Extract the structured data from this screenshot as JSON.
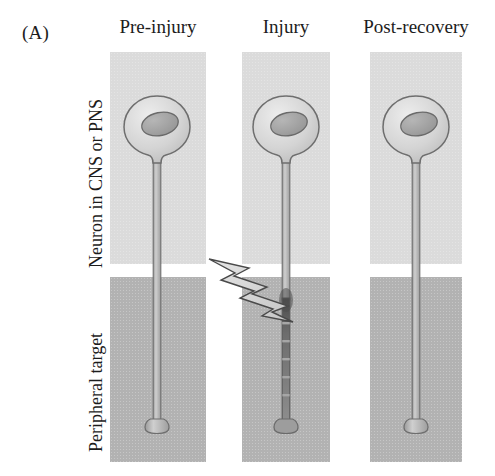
{
  "figure": {
    "panel_letter": "(A)",
    "columns": [
      {
        "id": "pre-injury",
        "label": "Pre-injury"
      },
      {
        "id": "injury",
        "label": "Injury"
      },
      {
        "id": "post-recovery",
        "label": "Post-recovery"
      }
    ],
    "rows": [
      {
        "id": "neuron",
        "label": "Neuron in CNS or PNS"
      },
      {
        "id": "peripheral-target",
        "label": "Peripheral target"
      }
    ],
    "colors": {
      "upper_panel": "#dbdbdb",
      "lower_panel": "#b2b2b2",
      "soma_fill": "#d2d2d2",
      "soma_outline": "#6e6e6e",
      "nucleus_fill": "#a3a3a3",
      "nucleus_outline": "#6a6a6a",
      "axon_fill": "#bdbdbd",
      "axon_outline": "#6e6e6e",
      "degenerating_axon": "#5f5f5f",
      "bolt_fill": "#d9d9d9",
      "bolt_outline": "#4a4a4a",
      "text": "#1c1c1c",
      "background": "#ffffff"
    },
    "elements": {
      "soma": "cell-body",
      "nucleus": "nucleus",
      "axon": "axon",
      "terminal": "axon-terminal-bouton",
      "bolt": "lightning-bolt-injury-marker"
    }
  }
}
